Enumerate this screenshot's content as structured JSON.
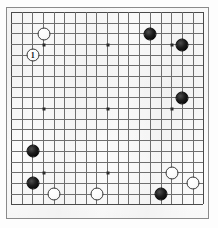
{
  "diagram": {
    "kind": "go-board-diagram",
    "board_size": 19,
    "colors": {
      "board_background": "#fbfbfb",
      "grid_line": "#6e6e6e",
      "border_line": "#4a4a4a",
      "black_stone": "#000000",
      "white_stone": "#ffffff",
      "star_point": "#2a2a2a",
      "page_background": "#fdfdfd"
    },
    "geometry": {
      "origin_x": 11,
      "origin_y": 12,
      "spacing": 10.68,
      "stone_diameter": 13,
      "star_points": [
        {
          "col": 3,
          "row": 3
        },
        {
          "col": 9,
          "row": 3
        },
        {
          "col": 15,
          "row": 3
        },
        {
          "col": 3,
          "row": 9
        },
        {
          "col": 9,
          "row": 9
        },
        {
          "col": 15,
          "row": 9
        },
        {
          "col": 3,
          "row": 15
        },
        {
          "col": 9,
          "row": 15
        },
        {
          "col": 15,
          "row": 15
        }
      ]
    },
    "stones": [
      {
        "id": "w-1",
        "color": "white",
        "col": 2,
        "row": 4,
        "label": "1",
        "name": "stone-white-move-1"
      },
      {
        "id": "w-2",
        "color": "white",
        "col": 3,
        "row": 2,
        "label": "",
        "name": "stone-white-d17"
      },
      {
        "id": "b-1",
        "color": "black",
        "col": 13,
        "row": 2,
        "label": "",
        "name": "stone-black-n17"
      },
      {
        "id": "b-2",
        "color": "black",
        "col": 16,
        "row": 3,
        "label": "",
        "name": "stone-black-q16"
      },
      {
        "id": "b-3",
        "color": "black",
        "col": 16,
        "row": 8,
        "label": "",
        "name": "stone-black-q11"
      },
      {
        "id": "b-4",
        "color": "black",
        "col": 2,
        "row": 13,
        "label": "",
        "name": "stone-black-c6"
      },
      {
        "id": "b-5",
        "color": "black",
        "col": 2,
        "row": 16,
        "label": "",
        "name": "stone-black-c3"
      },
      {
        "id": "w-3",
        "color": "white",
        "col": 4,
        "row": 17,
        "label": "",
        "name": "stone-white-e2"
      },
      {
        "id": "w-4",
        "color": "white",
        "col": 8,
        "row": 17,
        "label": "",
        "name": "stone-white-j2"
      },
      {
        "id": "w-5",
        "color": "white",
        "col": 15,
        "row": 15,
        "label": "",
        "name": "stone-white-q4"
      },
      {
        "id": "w-6",
        "color": "white",
        "col": 17,
        "row": 16,
        "label": "",
        "name": "stone-white-s3"
      },
      {
        "id": "b-6",
        "color": "black",
        "col": 14,
        "row": 17,
        "label": "",
        "name": "stone-black-o2"
      }
    ]
  }
}
